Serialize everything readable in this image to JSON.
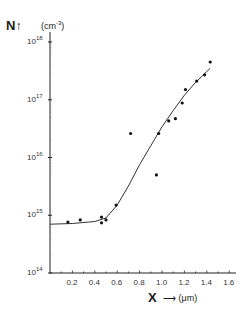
{
  "chart_data": {
    "type": "scatter",
    "title": "",
    "ylabel": "N",
    "yunit": "(cm⁻³)",
    "xlabel": "X",
    "xunit": "(μm)",
    "yscale": "log",
    "ylim": [
      100000000000000.0,
      1e+18
    ],
    "xlim": [
      0,
      1.6
    ],
    "xticks": [
      "0.2",
      "0.4",
      "0.6",
      "0.8",
      "1.0",
      "1.2",
      "1.4",
      "1.6"
    ],
    "yticks": [
      "10^14",
      "10^15",
      "10^16",
      "10^17",
      "10^18"
    ],
    "grid": false,
    "legend": null,
    "series": [
      {
        "name": "measured",
        "kind": "points",
        "x": [
          0.16,
          0.27,
          0.46,
          0.46,
          0.5,
          0.59,
          0.72,
          0.95,
          0.97,
          1.06,
          1.12,
          1.18,
          1.21,
          1.31,
          1.38,
          1.43
        ],
        "y": [
          760000000000000.0,
          830000000000000.0,
          930000000000000.0,
          740000000000000.0,
          830000000000000.0,
          1500000000000000.0,
          2.6e+16,
          5000000000000000.0,
          2.6e+16,
          4.3e+16,
          4.7e+16,
          8.8e+16,
          1.5e+17,
          2.1e+17,
          2.7e+17,
          4.5e+17
        ]
      },
      {
        "name": "fit",
        "kind": "line",
        "x": [
          0.0,
          0.2,
          0.4,
          0.5,
          0.6,
          0.7,
          0.8,
          0.9,
          1.0,
          1.1,
          1.2,
          1.3,
          1.43
        ],
        "y": [
          700000000000000.0,
          720000000000000.0,
          780000000000000.0,
          900000000000000.0,
          1500000000000000.0,
          3200000000000000.0,
          7500000000000000.0,
          1.6e+16,
          3.4e+16,
          6.5e+16,
          1.2e+17,
          2e+17,
          3.5e+17
        ]
      }
    ]
  },
  "labels": {
    "y_axis": "N",
    "y_arrow": "↑",
    "y_unit": "(cm",
    "y_unit_exp": "-3",
    "y_unit_close": ")",
    "x_axis": "X",
    "x_arrow": "⟶",
    "x_unit": "(μm)",
    "ytick_base": "10",
    "ytick_exps": [
      "18",
      "17",
      "16",
      "15",
      "14"
    ],
    "xticks": [
      "0.2",
      "0.4",
      "0.6",
      "0.8",
      "1.0",
      "1.2",
      "1.4",
      "1.6"
    ]
  }
}
